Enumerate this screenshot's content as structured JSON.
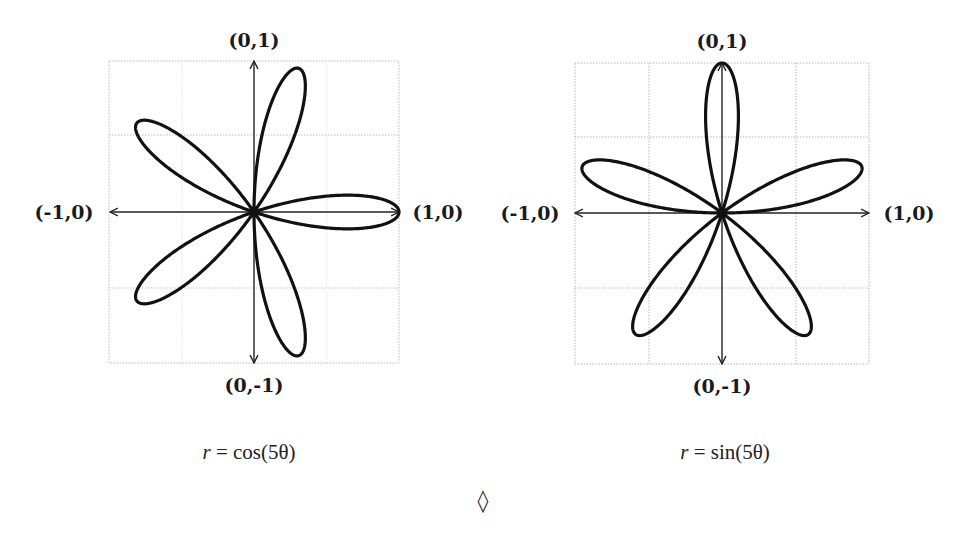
{
  "chart_data": [
    {
      "type": "line",
      "subtype": "polar-rose",
      "title": "r = cos(5θ)",
      "equation": "r = cos(5θ)",
      "petals": 5,
      "petal_tip_angles_deg": [
        0,
        72,
        144,
        216,
        288
      ],
      "axis_labels": {
        "top": "(0,1)",
        "bottom": "(0,-1)",
        "left": "(-1,0)",
        "right": "(1,0)"
      },
      "xlim": [
        -1,
        1
      ],
      "ylim": [
        -1,
        1
      ],
      "grid": true
    },
    {
      "type": "line",
      "subtype": "polar-rose",
      "title": "r = sin(5θ)",
      "equation": "r = sin(5θ)",
      "petals": 5,
      "petal_tip_angles_deg": [
        18,
        90,
        162,
        234,
        306
      ],
      "axis_labels": {
        "top": "(0,1)",
        "bottom": "(0,-1)",
        "left": "(-1,0)",
        "right": "(1,0)"
      },
      "xlim": [
        -1,
        1
      ],
      "ylim": [
        -1,
        1
      ],
      "grid": true
    }
  ],
  "plots": [
    {
      "labels": {
        "top": "(0,1)",
        "bottom": "(0,-1)",
        "left": "(-1,0)",
        "right": "(1,0)"
      },
      "caption_var": "r",
      "caption_eq": " = cos(5θ)"
    },
    {
      "labels": {
        "top": "(0,1)",
        "bottom": "(0,-1)",
        "left": "(-1,0)",
        "right": "(1,0)"
      },
      "caption_var": "r",
      "caption_eq": " = sin(5θ)"
    }
  ],
  "separator": "◊",
  "colors": {
    "curve": "#111111",
    "axis": "#222222",
    "grid": "#b8b8b8"
  }
}
